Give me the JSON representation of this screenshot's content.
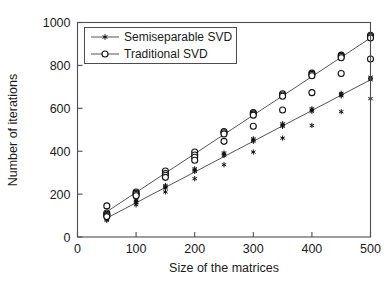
{
  "chart_data": {
    "type": "scatter",
    "title": "",
    "xlabel": "Size of the matrices",
    "ylabel": "Number of iterations",
    "xlim": [
      0,
      500
    ],
    "ylim": [
      0,
      1000
    ],
    "xticks": [
      0,
      100,
      200,
      300,
      400,
      500
    ],
    "yticks": [
      0,
      200,
      400,
      600,
      800,
      1000
    ],
    "xtick_labels": [
      "0",
      "100",
      "200",
      "300",
      "400",
      "500"
    ],
    "ytick_labels": [
      "0",
      "200",
      "400",
      "600",
      "800",
      "1000"
    ],
    "grid": false,
    "legend_position": "upper left",
    "series": [
      {
        "name": "Semiseparable SVD",
        "marker": "star",
        "marker_label": "star-marker",
        "color": "#111111",
        "has_fit_line": true,
        "fit_line": {
          "x": [
            50,
            500
          ],
          "y": [
            88,
            733
          ]
        },
        "x": [
          50,
          50,
          50,
          50,
          50,
          100,
          100,
          100,
          100,
          150,
          150,
          150,
          150,
          200,
          200,
          200,
          200,
          250,
          250,
          250,
          250,
          300,
          300,
          300,
          300,
          350,
          350,
          350,
          350,
          400,
          400,
          400,
          400,
          450,
          450,
          450,
          450,
          500,
          500,
          500,
          500
        ],
        "y": [
          95,
          90,
          86,
          82,
          78,
          172,
          166,
          160,
          150,
          240,
          234,
          228,
          210,
          318,
          312,
          306,
          272,
          392,
          386,
          380,
          337,
          458,
          452,
          446,
          396,
          528,
          522,
          516,
          461,
          598,
          592,
          586,
          520,
          670,
          664,
          658,
          584,
          745,
          739,
          733,
          645
        ]
      },
      {
        "name": "Traditional SVD",
        "marker": "circle",
        "marker_label": "circle-marker",
        "color": "#111111",
        "has_fit_line": true,
        "fit_line": {
          "x": [
            50,
            500
          ],
          "y": [
            118,
            928
          ]
        },
        "x": [
          50,
          50,
          50,
          50,
          50,
          100,
          100,
          100,
          100,
          150,
          150,
          150,
          150,
          200,
          200,
          200,
          200,
          250,
          250,
          250,
          250,
          300,
          300,
          300,
          300,
          350,
          350,
          350,
          350,
          400,
          400,
          400,
          400,
          450,
          450,
          450,
          450,
          500,
          500,
          500,
          500
        ],
        "y": [
          145,
          112,
          106,
          100,
          95,
          210,
          204,
          198,
          192,
          308,
          296,
          288,
          278,
          396,
          382,
          372,
          358,
          492,
          486,
          480,
          446,
          580,
          574,
          568,
          516,
          668,
          662,
          656,
          592,
          764,
          758,
          752,
          673,
          848,
          842,
          836,
          762,
          940,
          934,
          928,
          830
        ]
      }
    ]
  },
  "legend": {
    "entries": [
      {
        "label": "Semiseparable SVD",
        "marker": "star"
      },
      {
        "label": "Traditional SVD",
        "marker": "circle"
      }
    ]
  }
}
